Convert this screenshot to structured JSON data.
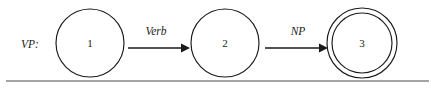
{
  "figure": {
    "name": "VP:",
    "label": "VP:",
    "label_x": 30,
    "label_y": 48
  },
  "states": [
    {
      "id": "1",
      "label": "1",
      "cx": 90,
      "cy": 43,
      "r": 34,
      "accepting": false,
      "name": "state-1"
    },
    {
      "id": "2",
      "label": "2",
      "cx": 225,
      "cy": 43,
      "r": 34,
      "accepting": false,
      "name": "state-2"
    },
    {
      "id": "3",
      "label": "3",
      "cx": 362,
      "cy": 43,
      "r": 30,
      "r_outer": 35,
      "accepting": true,
      "name": "state-3"
    }
  ],
  "transitions": [
    {
      "label": "Verb",
      "from": "1",
      "to": "2",
      "x1": 128,
      "x2": 188,
      "y": 48,
      "label_x": 156,
      "label_y": 35,
      "name": "transition-verb"
    },
    {
      "label": "NP",
      "from": "2",
      "to": "3",
      "x1": 265,
      "x2": 326,
      "y": 48,
      "label_x": 298,
      "label_y": 35,
      "name": "transition-np"
    }
  ],
  "rule": {
    "x1": 6,
    "x2": 429,
    "y": 81
  },
  "colors": {
    "stroke": "#1a1a1a",
    "rule": "#4a4a4a",
    "background": "#ffffff"
  }
}
